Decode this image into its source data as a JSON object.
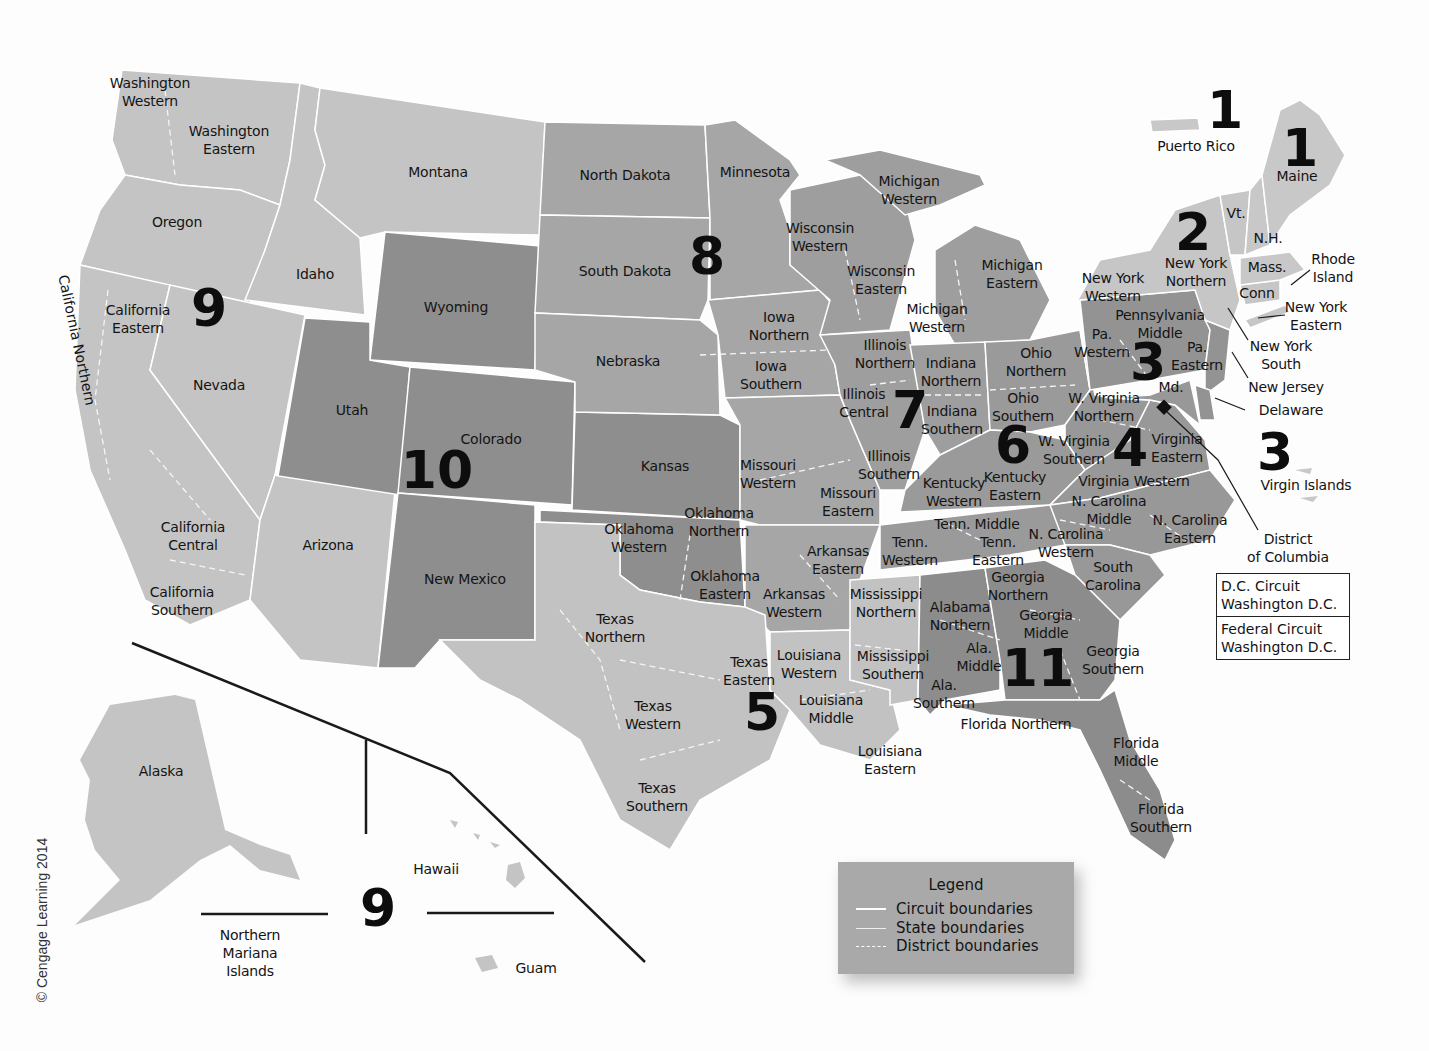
{
  "map": {
    "title": "U.S. Federal Court Circuits and Districts",
    "colors": {
      "background": "#fdfdfd",
      "light_gray": "#c4c4c4",
      "medium_gray": "#a6a6a6",
      "dark_gray": "#8a8a8a",
      "boundary": "#ffffff",
      "text": "#141414"
    },
    "copyright": "© Cengage Learning 2014",
    "circuits": [
      {
        "number": "1",
        "x": 1225,
        "y": 110
      },
      {
        "number": "1",
        "x": 1300,
        "y": 148
      },
      {
        "number": "2",
        "x": 1193,
        "y": 232
      },
      {
        "number": "3",
        "x": 1148,
        "y": 362
      },
      {
        "number": "3",
        "x": 1275,
        "y": 452
      },
      {
        "number": "4",
        "x": 1130,
        "y": 448
      },
      {
        "number": "5",
        "x": 762,
        "y": 712
      },
      {
        "number": "6",
        "x": 1013,
        "y": 445
      },
      {
        "number": "7",
        "x": 910,
        "y": 410
      },
      {
        "number": "8",
        "x": 707,
        "y": 256
      },
      {
        "number": "9",
        "x": 209,
        "y": 308
      },
      {
        "number": "9",
        "x": 378,
        "y": 908
      },
      {
        "number": "10",
        "x": 437,
        "y": 470
      },
      {
        "number": "11",
        "x": 1038,
        "y": 668
      }
    ],
    "district_labels": [
      {
        "text": "Washington\nWestern",
        "x": 150,
        "y": 92
      },
      {
        "text": "Washington\nEastern",
        "x": 229,
        "y": 140
      },
      {
        "text": "Montana",
        "x": 438,
        "y": 172
      },
      {
        "text": "Oregon",
        "x": 177,
        "y": 222
      },
      {
        "text": "Idaho",
        "x": 315,
        "y": 274
      },
      {
        "text": "California\nEastern",
        "x": 138,
        "y": 319
      },
      {
        "text": "Nevada",
        "x": 219,
        "y": 385
      },
      {
        "text": "California\nCentral",
        "x": 193,
        "y": 536
      },
      {
        "text": "California\nSouthern",
        "x": 182,
        "y": 601
      },
      {
        "text": "Arizona",
        "x": 328,
        "y": 545
      },
      {
        "text": "Wyoming",
        "x": 456,
        "y": 307
      },
      {
        "text": "Utah",
        "x": 352,
        "y": 410
      },
      {
        "text": "Colorado",
        "x": 491,
        "y": 439
      },
      {
        "text": "New Mexico",
        "x": 465,
        "y": 579
      },
      {
        "text": "North Dakota",
        "x": 625,
        "y": 175
      },
      {
        "text": "Minnesota",
        "x": 755,
        "y": 172
      },
      {
        "text": "South Dakota",
        "x": 625,
        "y": 271
      },
      {
        "text": "Nebraska",
        "x": 628,
        "y": 361
      },
      {
        "text": "Kansas",
        "x": 665,
        "y": 466
      },
      {
        "text": "Iowa\nNorthern",
        "x": 779,
        "y": 326
      },
      {
        "text": "Iowa\nSouthern",
        "x": 771,
        "y": 375
      },
      {
        "text": "Missouri\nWestern",
        "x": 768,
        "y": 474
      },
      {
        "text": "Missouri\nEastern",
        "x": 848,
        "y": 502
      },
      {
        "text": "Oklahoma\nWestern",
        "x": 639,
        "y": 538
      },
      {
        "text": "Oklahoma\nNorthern",
        "x": 719,
        "y": 522
      },
      {
        "text": "Oklahoma\nEastern",
        "x": 725,
        "y": 585
      },
      {
        "text": "Arkansas\nEastern",
        "x": 838,
        "y": 560
      },
      {
        "text": "Arkansas\nWestern",
        "x": 794,
        "y": 603
      },
      {
        "text": "Texas\nNorthern",
        "x": 615,
        "y": 628
      },
      {
        "text": "Texas\nEastern",
        "x": 749,
        "y": 671
      },
      {
        "text": "Texas\nWestern",
        "x": 653,
        "y": 715
      },
      {
        "text": "Texas\nSouthern",
        "x": 657,
        "y": 797
      },
      {
        "text": "Louisiana\nWestern",
        "x": 809,
        "y": 664
      },
      {
        "text": "Louisiana\nMiddle",
        "x": 831,
        "y": 709
      },
      {
        "text": "Louisiana\nEastern",
        "x": 890,
        "y": 760
      },
      {
        "text": "Mississippi\nNorthern",
        "x": 886,
        "y": 603
      },
      {
        "text": "Mississippi\nSouthern",
        "x": 893,
        "y": 665
      },
      {
        "text": "Wisconsin\nWestern",
        "x": 820,
        "y": 237
      },
      {
        "text": "Wisconsin\nEastern",
        "x": 881,
        "y": 280
      },
      {
        "text": "Michigan\nWestern",
        "x": 909,
        "y": 190
      },
      {
        "text": "Michigan\nEastern",
        "x": 1012,
        "y": 274
      },
      {
        "text": "Michigan\nWestern",
        "x": 937,
        "y": 318
      },
      {
        "text": "Illinois\nNorthern",
        "x": 885,
        "y": 354
      },
      {
        "text": "Illinois\nCentral",
        "x": 864,
        "y": 403
      },
      {
        "text": "Illinois\nSouthern",
        "x": 889,
        "y": 465
      },
      {
        "text": "Indiana\nNorthern",
        "x": 951,
        "y": 372
      },
      {
        "text": "Indiana\nSouthern",
        "x": 952,
        "y": 420
      },
      {
        "text": "Ohio\nNorthern",
        "x": 1036,
        "y": 362
      },
      {
        "text": "Ohio\nSouthern",
        "x": 1023,
        "y": 407
      },
      {
        "text": "Kentucky\nWestern",
        "x": 954,
        "y": 492
      },
      {
        "text": "Kentucky\nEastern",
        "x": 1015,
        "y": 486
      },
      {
        "text": "Tenn. Middle",
        "x": 977,
        "y": 524
      },
      {
        "text": "Tenn.\nWestern",
        "x": 910,
        "y": 551
      },
      {
        "text": "Tenn.\nEastern",
        "x": 998,
        "y": 551
      },
      {
        "text": "W. Virginia\nNorthern",
        "x": 1104,
        "y": 407
      },
      {
        "text": "W. Virginia\nSouthern",
        "x": 1074,
        "y": 450
      },
      {
        "text": "Virginia\nEastern",
        "x": 1177,
        "y": 448
      },
      {
        "text": "Virginia Western",
        "x": 1134,
        "y": 481
      },
      {
        "text": "N. Carolina\nMiddle",
        "x": 1109,
        "y": 510
      },
      {
        "text": "N. Carolina\nEastern",
        "x": 1190,
        "y": 529
      },
      {
        "text": "N. Carolina\nWestern",
        "x": 1066,
        "y": 543
      },
      {
        "text": "South\nCarolina",
        "x": 1113,
        "y": 576
      },
      {
        "text": "Georgia\nNorthern",
        "x": 1018,
        "y": 586
      },
      {
        "text": "Georgia\nMiddle",
        "x": 1046,
        "y": 624
      },
      {
        "text": "Georgia\nSouthern",
        "x": 1113,
        "y": 660
      },
      {
        "text": "Alabama\nNorthern",
        "x": 960,
        "y": 616
      },
      {
        "text": "Ala.\nMiddle",
        "x": 979,
        "y": 657
      },
      {
        "text": "Ala.\nSouthern",
        "x": 944,
        "y": 694
      },
      {
        "text": "Florida Northern",
        "x": 1016,
        "y": 724
      },
      {
        "text": "Florida\nMiddle",
        "x": 1136,
        "y": 752
      },
      {
        "text": "Florida\nSouthern",
        "x": 1161,
        "y": 818
      },
      {
        "text": "New York\nWestern",
        "x": 1113,
        "y": 287
      },
      {
        "text": "New York\nNorthern",
        "x": 1196,
        "y": 272
      },
      {
        "text": "Pennsylvania\nMiddle",
        "x": 1160,
        "y": 324
      },
      {
        "text": "Pa.\nWestern",
        "x": 1102,
        "y": 343
      },
      {
        "text": "Pa.\nEastern",
        "x": 1197,
        "y": 356
      },
      {
        "text": "Md.",
        "x": 1171,
        "y": 387
      },
      {
        "text": "Vt.",
        "x": 1236,
        "y": 213
      },
      {
        "text": "N.H.",
        "x": 1268,
        "y": 238
      },
      {
        "text": "Mass.",
        "x": 1267,
        "y": 267
      },
      {
        "text": "Conn",
        "x": 1257,
        "y": 293
      },
      {
        "text": "Maine",
        "x": 1297,
        "y": 176
      },
      {
        "text": "Puerto Rico",
        "x": 1196,
        "y": 146
      },
      {
        "text": "Rhode\nIsland",
        "x": 1333,
        "y": 268
      },
      {
        "text": "New York\nEastern",
        "x": 1316,
        "y": 316
      },
      {
        "text": "New York\nSouth",
        "x": 1281,
        "y": 355
      },
      {
        "text": "New Jersey",
        "x": 1286,
        "y": 387
      },
      {
        "text": "Delaware",
        "x": 1291,
        "y": 410
      },
      {
        "text": "Virgin Islands",
        "x": 1306,
        "y": 485
      },
      {
        "text": "District\nof Columbia",
        "x": 1288,
        "y": 548
      },
      {
        "text": "Alaska",
        "x": 161,
        "y": 771
      },
      {
        "text": "Hawaii",
        "x": 436,
        "y": 869
      },
      {
        "text": "Northern\nMariana\nIslands",
        "x": 250,
        "y": 953
      },
      {
        "text": "Guam",
        "x": 536,
        "y": 968
      }
    ],
    "california_northern": "California Northern",
    "dc_box": {
      "rows": [
        "D.C. Circuit\nWashington D.C.",
        "Federal Circuit\nWashington D.C."
      ]
    },
    "legend": {
      "title": "Legend",
      "items": [
        {
          "label": "Circuit boundaries",
          "style": "solid-thick"
        },
        {
          "label": "State boundaries",
          "style": "solid-thin"
        },
        {
          "label": "District boundaries",
          "style": "dashed"
        }
      ]
    }
  }
}
